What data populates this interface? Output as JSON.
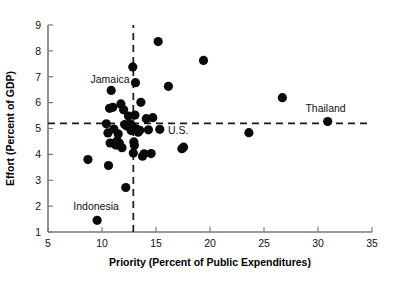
{
  "chart_data": {
    "type": "scatter",
    "title": "",
    "xlabel": "Priority (Percent of Public Expenditures)",
    "ylabel": "Effort (Percent of GDP)",
    "xlim": [
      5,
      35
    ],
    "ylim": [
      1,
      9
    ],
    "xticks": [
      5,
      10,
      15,
      20,
      25,
      30,
      35
    ],
    "yticks": [
      1,
      2,
      3,
      4,
      5,
      6,
      7,
      8,
      9
    ],
    "xtick_labels": [
      "5",
      "10",
      "15",
      "20",
      "25",
      "30",
      "35"
    ],
    "ytick_labels": [
      "1",
      "2",
      "3",
      "4",
      "5",
      "6",
      "7",
      "8",
      "9"
    ],
    "grid": false,
    "legend": "none",
    "marker_color": "#0a0a0a",
    "marker_size_px": 4.6,
    "reference_lines": [
      {
        "orientation": "vertical",
        "value": 12.9,
        "style": "dashed",
        "color": "#1a1a1a"
      },
      {
        "orientation": "horizontal",
        "value": 5.2,
        "style": "dashed",
        "color": "#1a1a1a"
      }
    ],
    "x": [
      8.7,
      9.55,
      10.4,
      10.55,
      10.6,
      10.7,
      10.75,
      10.85,
      11.0,
      11.1,
      11.15,
      11.2,
      11.3,
      11.4,
      11.5,
      11.6,
      11.75,
      11.85,
      12.0,
      12.1,
      12.2,
      12.3,
      12.45,
      12.55,
      12.6,
      12.7,
      12.8,
      12.85,
      12.9,
      12.95,
      13.0,
      13.05,
      13.1,
      13.2,
      13.35,
      13.5,
      13.6,
      13.75,
      13.9,
      14.1,
      14.3,
      14.55,
      14.7,
      15.2,
      15.35,
      16.15,
      17.4,
      17.55,
      19.4,
      23.6,
      26.7,
      30.9
    ],
    "y": [
      3.8,
      1.45,
      5.18,
      4.83,
      3.57,
      5.78,
      4.44,
      6.47,
      5.82,
      4.98,
      4.43,
      4.4,
      4.36,
      4.52,
      4.79,
      4.44,
      5.95,
      4.26,
      5.72,
      5.15,
      2.72,
      5.1,
      5.48,
      5.17,
      5.12,
      4.92,
      5.1,
      7.38,
      4.05,
      4.48,
      4.35,
      5.52,
      6.77,
      4.98,
      4.86,
      4.93,
      6.01,
      3.93,
      4.02,
      5.38,
      4.95,
      4.03,
      5.42,
      8.36,
      4.97,
      6.63,
      4.22,
      4.28,
      7.63,
      4.84,
      6.19,
      5.27
    ],
    "annotations": [
      {
        "label": "Jamaica",
        "x": 11.0,
        "y": 6.47,
        "text_x": 10.75,
        "text_y": 6.88
      },
      {
        "label": "Indonesia",
        "x": 9.55,
        "y": 1.45,
        "text_x": 9.45,
        "text_y": 2.0
      },
      {
        "label": "U.S.",
        "x": 15.35,
        "y": 4.97,
        "text_x": 16.1,
        "text_y": 4.92
      },
      {
        "label": "Thailand",
        "x": 30.9,
        "y": 5.27,
        "text_x": 30.7,
        "text_y": 5.78
      }
    ]
  }
}
